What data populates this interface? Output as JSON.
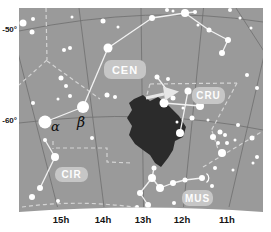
{
  "colors": {
    "page_bg": "#ffffff",
    "map_bg": "#9a9a9a",
    "grid_line": "#6e6e6e",
    "boundary_dash": "#d4d4d4",
    "stick_line": "#f2f2f2",
    "star": "#ffffff",
    "coalsack": "#2b2b2b",
    "pill_bg": "#c6c6c6",
    "pill_text": "#fdfdfd",
    "axis_text": "#141414",
    "arrow": "#e6e6e6"
  },
  "axis": {
    "dec_labels": [
      {
        "text": "-50°",
        "top": 26
      },
      {
        "text": "-60°",
        "top": 117
      }
    ],
    "ra_labels": [
      {
        "text": "15h",
        "x": 61
      },
      {
        "text": "14h",
        "x": 103
      },
      {
        "text": "13h",
        "x": 143
      },
      {
        "text": "12h",
        "x": 182
      },
      {
        "text": "11h",
        "x": 227
      }
    ]
  },
  "constellation_labels": [
    {
      "id": "cen",
      "text": "CEN",
      "left": 104,
      "top": 60,
      "w": 42,
      "h": 19,
      "fs": 11
    },
    {
      "id": "cru",
      "text": "CRU",
      "left": 192,
      "top": 87,
      "w": 33,
      "h": 17,
      "fs": 10
    },
    {
      "id": "cir",
      "text": "CIR",
      "left": 55,
      "top": 167,
      "w": 33,
      "h": 15,
      "fs": 10
    },
    {
      "id": "mus",
      "text": "MUS",
      "left": 182,
      "top": 190,
      "w": 31,
      "h": 16,
      "fs": 10
    }
  ],
  "star_labels": [
    {
      "text": "α",
      "left": 51,
      "top": 120,
      "fs": 13
    },
    {
      "text": "β",
      "left": 77,
      "top": 115,
      "fs": 14
    }
  ],
  "map": {
    "outline": "M19,8 L263,8 L263,212 Q141,203 19,212 Z",
    "grid_lines": [
      "M57.5,207 L6.5,8",
      "M104,207 L79,8",
      "M143.5,207 L141,8",
      "M183.5,207 L203.5,8",
      "M229,207 L275,8",
      "M236,8 L267,56",
      "M19,31 Q150,4 263,22",
      "M19,123 Q150,107 263,130"
    ],
    "boundary_paths": [
      "M46,8 L47,60",
      "M47,60 L19,85",
      "M47,61 L100,99",
      "M53,141 L53,149",
      "M56,148 L107,148 L107,162 L132,163",
      "M150,84 L237,83",
      "M150,84 L141,116",
      "M237,83 L211,131",
      "M212,131 L218,149",
      "M203,167 L263,131",
      "M22,207 Q80,199 140,208"
    ],
    "coalsack": [
      [
        134,
        99
      ],
      [
        143,
        95
      ],
      [
        150,
        101
      ],
      [
        158,
        97
      ],
      [
        166,
        103
      ],
      [
        172,
        109
      ],
      [
        179,
        116
      ],
      [
        186,
        127
      ],
      [
        183,
        137
      ],
      [
        175,
        141
      ],
      [
        173,
        150
      ],
      [
        168,
        158
      ],
      [
        161,
        167
      ],
      [
        155,
        163
      ],
      [
        150,
        155
      ],
      [
        143,
        150
      ],
      [
        135,
        144
      ],
      [
        129,
        135
      ],
      [
        132,
        126
      ],
      [
        127,
        118
      ],
      [
        132,
        110
      ],
      [
        129,
        103
      ]
    ],
    "stick_lines": [
      [
        45,
        122,
        83,
        107
      ],
      [
        83,
        107,
        108,
        48
      ],
      [
        108,
        48,
        152,
        18
      ],
      [
        152,
        18,
        185,
        13
      ],
      [
        185,
        13,
        195,
        12
      ],
      [
        185,
        13,
        209,
        30
      ],
      [
        209,
        30,
        228,
        40
      ],
      [
        228,
        40,
        222,
        53
      ],
      [
        157,
        77,
        173,
        98
      ],
      [
        164,
        103,
        200,
        106
      ],
      [
        188,
        91,
        180,
        133
      ],
      [
        140,
        193,
        152,
        178
      ],
      [
        140,
        193,
        148,
        205
      ],
      [
        152,
        178,
        160,
        188
      ],
      [
        160,
        188,
        173,
        183
      ],
      [
        173,
        183,
        185,
        180
      ],
      [
        185,
        180,
        202,
        178
      ],
      [
        152,
        178,
        154,
        168
      ],
      [
        45,
        140,
        55,
        157
      ],
      [
        55,
        157,
        40,
        188
      ]
    ],
    "stars": [
      [
        23,
        23,
        3.5
      ],
      [
        33,
        19,
        2
      ],
      [
        32,
        32,
        2.5
      ],
      [
        72,
        17,
        1.5
      ],
      [
        103,
        21,
        2.5
      ],
      [
        118,
        27,
        1.5
      ],
      [
        64,
        50,
        2
      ],
      [
        70,
        48,
        2
      ],
      [
        108,
        48,
        4.5
      ],
      [
        61,
        78,
        2.5
      ],
      [
        66,
        86,
        2
      ],
      [
        58,
        99,
        1.5
      ],
      [
        70,
        96,
        2
      ],
      [
        33,
        103,
        2
      ],
      [
        45,
        122,
        6.5
      ],
      [
        83,
        107,
        6
      ],
      [
        45,
        140,
        2
      ],
      [
        92,
        138,
        2
      ],
      [
        55,
        157,
        4
      ],
      [
        40,
        188,
        3
      ],
      [
        32,
        197,
        3
      ],
      [
        107,
        95,
        2.5
      ],
      [
        115,
        97,
        2
      ],
      [
        152,
        18,
        3
      ],
      [
        167,
        10,
        2
      ],
      [
        173,
        11,
        1.5
      ],
      [
        185,
        13,
        4
      ],
      [
        195,
        12,
        2
      ],
      [
        198,
        25,
        1.5
      ],
      [
        209,
        30,
        2.5
      ],
      [
        228,
        40,
        3
      ],
      [
        222,
        53,
        3
      ],
      [
        240,
        18,
        1.5
      ],
      [
        230,
        10,
        2
      ],
      [
        251,
        28,
        1.5
      ],
      [
        247,
        75,
        2
      ],
      [
        257,
        88,
        2
      ],
      [
        157,
        77,
        2.5
      ],
      [
        168,
        79,
        2
      ],
      [
        173,
        98,
        2.5
      ],
      [
        188,
        91,
        3.5
      ],
      [
        164,
        103,
        4.5
      ],
      [
        200,
        106,
        4
      ],
      [
        183,
        108,
        1.5
      ],
      [
        192,
        118,
        2.5
      ],
      [
        180,
        133,
        4
      ],
      [
        177,
        122,
        1.5
      ],
      [
        154,
        168,
        2.5
      ],
      [
        152,
        178,
        4
      ],
      [
        160,
        188,
        4
      ],
      [
        173,
        183,
        3
      ],
      [
        185,
        180,
        2.5
      ],
      [
        202,
        178,
        3
      ],
      [
        140,
        193,
        3
      ],
      [
        148,
        205,
        3
      ],
      [
        137,
        207,
        2
      ],
      [
        174,
        203,
        2
      ],
      [
        58,
        201,
        2
      ],
      [
        213,
        137,
        3
      ],
      [
        220,
        132,
        2.5
      ],
      [
        225,
        135,
        2
      ],
      [
        218,
        143,
        2
      ],
      [
        227,
        143,
        2
      ],
      [
        222,
        153,
        4
      ],
      [
        235,
        140,
        1.5
      ],
      [
        252,
        138,
        2.5
      ],
      [
        238,
        125,
        2
      ],
      [
        208,
        120,
        1.5
      ],
      [
        257,
        157,
        2
      ],
      [
        215,
        168,
        2
      ],
      [
        233,
        170,
        1.5
      ],
      [
        253,
        163,
        1.5
      ],
      [
        212,
        186,
        2
      ]
    ],
    "arrow": {
      "shaft": [
        146,
        98,
        164,
        94
      ],
      "head": [
        [
          163,
          86.5
        ],
        [
          179,
          91.5
        ],
        [
          165,
          100.5
        ]
      ]
    },
    "double_star_arc": "M206.5,173.5 A5.5,5.5 0 0 1 206.5,182.5"
  }
}
